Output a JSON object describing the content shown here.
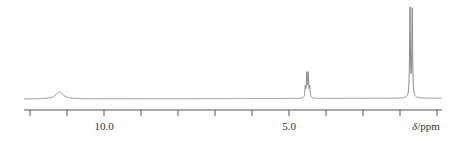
{
  "chart_data": {
    "type": "line",
    "title": "",
    "xlabel": "δ/ppm",
    "xlabel_parts": {
      "symbol": "δ",
      "unit": "/ppm"
    },
    "ylabel": "",
    "x_axis": {
      "reversed": true,
      "range": [
        12.0,
        1.0
      ],
      "tick_positions": [
        12,
        11,
        10,
        9,
        8,
        7,
        6,
        5,
        4,
        3,
        2,
        1
      ],
      "labeled_ticks": [
        {
          "value": 10.0,
          "label": "10.0"
        },
        {
          "value": 5.0,
          "label": "5.0"
        }
      ]
    },
    "grid": false,
    "legend": null,
    "line_color": "#8a8a8a",
    "axis_color": "#555555",
    "peaks": [
      {
        "shift_ppm": 11.2,
        "multiplicity": "broad singlet",
        "relative_height": 0.08,
        "lines": [
          11.2
        ]
      },
      {
        "shift_ppm": 4.5,
        "multiplicity": "quartet",
        "relative_height": 0.27,
        "lines": [
          4.56,
          4.52,
          4.48,
          4.44
        ]
      },
      {
        "shift_ppm": 1.7,
        "multiplicity": "doublet",
        "relative_height": 1.0,
        "lines": [
          1.73,
          1.67
        ]
      }
    ]
  }
}
